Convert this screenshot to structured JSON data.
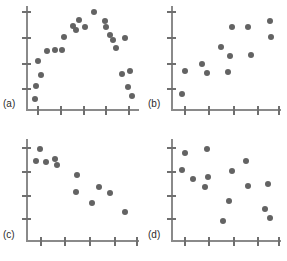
{
  "figure": {
    "type": "scatterplot-matrix",
    "panel_count": 4,
    "layout": "2x2",
    "axis_color": "#8a8a8a",
    "point_color": "#636363",
    "label_color": "#2b2b2b",
    "background": "#ffffff",
    "axis_labels_shown": false,
    "tick_numbers_shown": false
  },
  "chart_data": [
    {
      "id": "a",
      "type": "scatter",
      "label": "(a)",
      "title": "",
      "xlabel": "",
      "ylabel": "",
      "relationship": "curvilinear inverted-U",
      "xlim": [
        0,
        100
      ],
      "ylim": [
        0,
        100
      ],
      "grid": false,
      "legend": "none",
      "x_ticks": [
        10,
        30,
        50,
        70,
        90
      ],
      "y_ticks": [
        20,
        45,
        70,
        95
      ],
      "points": [
        {
          "x": 8,
          "y": 10
        },
        {
          "x": 9,
          "y": 22
        },
        {
          "x": 13,
          "y": 33
        },
        {
          "x": 11,
          "y": 47
        },
        {
          "x": 19,
          "y": 56
        },
        {
          "x": 26,
          "y": 57
        },
        {
          "x": 32,
          "y": 57
        },
        {
          "x": 34,
          "y": 70
        },
        {
          "x": 42,
          "y": 81
        },
        {
          "x": 44,
          "y": 77
        },
        {
          "x": 47,
          "y": 86
        },
        {
          "x": 52,
          "y": 80
        },
        {
          "x": 60,
          "y": 94
        },
        {
          "x": 70,
          "y": 85
        },
        {
          "x": 71,
          "y": 80
        },
        {
          "x": 74,
          "y": 72
        },
        {
          "x": 77,
          "y": 67
        },
        {
          "x": 80,
          "y": 59
        },
        {
          "x": 88,
          "y": 69
        },
        {
          "x": 85,
          "y": 34
        },
        {
          "x": 92,
          "y": 37
        },
        {
          "x": 90,
          "y": 21
        },
        {
          "x": 94,
          "y": 13
        }
      ]
    },
    {
      "id": "b",
      "type": "scatter",
      "label": "(b)",
      "title": "",
      "xlabel": "",
      "ylabel": "",
      "relationship": "positive linear",
      "xlim": [
        0,
        100
      ],
      "ylim": [
        0,
        100
      ],
      "grid": false,
      "legend": "none",
      "x_ticks": [
        12,
        34,
        56,
        78,
        97
      ],
      "y_ticks": [
        20,
        45,
        70,
        95
      ],
      "points": [
        {
          "x": 10,
          "y": 15
        },
        {
          "x": 13,
          "y": 37
        },
        {
          "x": 28,
          "y": 44
        },
        {
          "x": 33,
          "y": 35
        },
        {
          "x": 45,
          "y": 60
        },
        {
          "x": 52,
          "y": 36
        },
        {
          "x": 54,
          "y": 51
        },
        {
          "x": 55,
          "y": 80
        },
        {
          "x": 70,
          "y": 80
        },
        {
          "x": 73,
          "y": 52
        },
        {
          "x": 90,
          "y": 85
        },
        {
          "x": 91,
          "y": 70
        }
      ]
    },
    {
      "id": "c",
      "type": "scatter",
      "label": "(c)",
      "title": "",
      "xlabel": "",
      "ylabel": "",
      "relationship": "negative linear",
      "xlim": [
        0,
        100
      ],
      "ylim": [
        0,
        100
      ],
      "grid": false,
      "legend": "none",
      "x_ticks": [
        12,
        34,
        56,
        78,
        97
      ],
      "y_ticks": [
        22,
        45,
        68,
        92
      ],
      "points": [
        {
          "x": 12,
          "y": 90
        },
        {
          "x": 9,
          "y": 78
        },
        {
          "x": 18,
          "y": 77
        },
        {
          "x": 26,
          "y": 80
        },
        {
          "x": 27,
          "y": 74
        },
        {
          "x": 45,
          "y": 64
        },
        {
          "x": 44,
          "y": 48
        },
        {
          "x": 58,
          "y": 37
        },
        {
          "x": 65,
          "y": 52
        },
        {
          "x": 74,
          "y": 47
        },
        {
          "x": 88,
          "y": 28
        }
      ]
    },
    {
      "id": "d",
      "type": "scatter",
      "label": "(d)",
      "title": "",
      "xlabel": "",
      "ylabel": "",
      "relationship": "no relationship",
      "xlim": [
        0,
        100
      ],
      "ylim": [
        0,
        100
      ],
      "grid": false,
      "legend": "none",
      "x_ticks": [
        12,
        34,
        56,
        78,
        97
      ],
      "y_ticks": [
        22,
        45,
        68,
        92
      ],
      "points": [
        {
          "x": 13,
          "y": 86
        },
        {
          "x": 10,
          "y": 69
        },
        {
          "x": 20,
          "y": 60
        },
        {
          "x": 33,
          "y": 90
        },
        {
          "x": 34,
          "y": 62
        },
        {
          "x": 31,
          "y": 52
        },
        {
          "x": 47,
          "y": 19
        },
        {
          "x": 55,
          "y": 68
        },
        {
          "x": 53,
          "y": 39
        },
        {
          "x": 68,
          "y": 78
        },
        {
          "x": 70,
          "y": 53
        },
        {
          "x": 85,
          "y": 31
        },
        {
          "x": 88,
          "y": 55
        },
        {
          "x": 90,
          "y": 22
        }
      ]
    }
  ]
}
